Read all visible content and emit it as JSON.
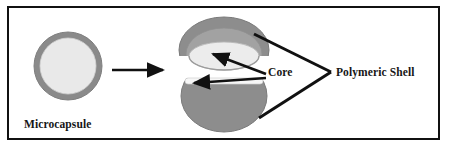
{
  "figure": {
    "title_visible": false,
    "background_color": "#ffffff",
    "border_color": "#111111",
    "labels": {
      "microcapsule": "Microcapsule",
      "core": "Core",
      "polymeric_shell": "Polymeric Shell"
    },
    "colors": {
      "shell_outer": "#8a8a8a",
      "shell_mid": "#9a9a9a",
      "shell_dark": "#7d7d7d",
      "core_light": "#e9e9e9",
      "core_white": "#f7f7f7",
      "outline": "#6f6f6f",
      "arrow": "#111111",
      "text": "#161616"
    },
    "diagram": {
      "type": "schematic",
      "left_object": {
        "name": "microcapsule-cross-section",
        "shape": "circle",
        "center_x": 68,
        "center_y": 66,
        "outer_radius": 34,
        "shell_thickness": 6,
        "shell_color": "#8a8a8a",
        "core_color": "#e9e9e9"
      },
      "transition_arrow": {
        "name": "process-arrow",
        "from_x": 112,
        "to_x": 168,
        "y": 70,
        "direction": "right",
        "color": "#111111"
      },
      "right_object": {
        "name": "opened-capsule",
        "center_x": 224,
        "lid": {
          "label": "upper-hemisphere-lid",
          "center_y": 48,
          "rx": 44,
          "ry": 28,
          "cavity_rx": 34,
          "cavity_ry": 14
        },
        "bowl": {
          "label": "lower-hemisphere-bowl",
          "center_y": 100,
          "rx": 42,
          "ry": 33,
          "rim_band_color": "#f7f7f7"
        }
      },
      "callouts": [
        {
          "name": "core-upper-arrow",
          "target": "upper-cavity",
          "label": "Core",
          "from_x": 266,
          "from_y": 75,
          "to_x": 215,
          "to_y": 55
        },
        {
          "name": "core-lower-arrow",
          "target": "lower-rim-band",
          "label": "Core",
          "from_x": 266,
          "from_y": 78,
          "to_x": 196,
          "to_y": 83
        },
        {
          "name": "polymeric-shell-bracket",
          "label": "Polymeric Shell",
          "apex_x": 331,
          "apex_y": 72,
          "upper_x": 254,
          "upper_y": 34,
          "lower_x": 259,
          "lower_y": 118
        }
      ]
    }
  }
}
